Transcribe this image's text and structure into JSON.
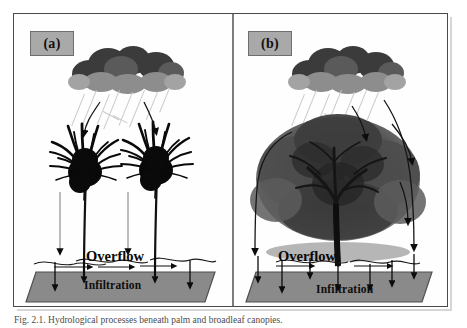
{
  "figure": {
    "caption": "Fig. 2.1. Hydrological processes beneath palm and broadleaf canopies.",
    "background_color": "#ffffff",
    "frame_color": "#4a4a4a",
    "divider_color": "#7d7d7d"
  },
  "panels": [
    {
      "id": "a",
      "label": "(a)",
      "label_chip_color": "#a9a9a9",
      "subject": "palm-trees",
      "tree_count": 2,
      "labels": {
        "overflow": "Overflow",
        "infiltration": "Infiltration"
      },
      "soil_color": "#8a8a8a",
      "cloud_colors": {
        "upper": "#3b3b3b",
        "middle": "#5a5a5a",
        "lower": "#8d8d8d"
      },
      "rain_color": "#c9c9c9"
    },
    {
      "id": "b",
      "label": "(b)",
      "label_chip_color": "#a9a9a9",
      "subject": "broadleaf-tree",
      "tree_count": 1,
      "labels": {
        "overflow": "Overflow",
        "infiltration": "Infiltration"
      },
      "soil_color": "#8a8a8a",
      "cloud_colors": {
        "upper": "#3b3b3b",
        "middle": "#5a5a5a",
        "lower": "#8d8d8d"
      },
      "rain_color": "#c9c9c9"
    }
  ]
}
